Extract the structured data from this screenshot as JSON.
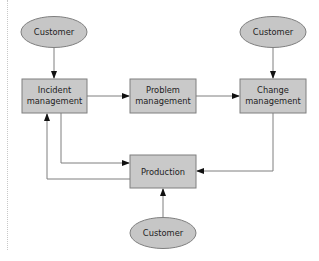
{
  "diagram": {
    "colors": {
      "box_fill": "#c9c9c9",
      "ellipse_fill": "#c6c6c6",
      "stroke": "#7f7f7f",
      "text": "#222222"
    },
    "nodes": {
      "customer_top_left": {
        "label": "Customer",
        "shape": "ellipse"
      },
      "customer_top_right": {
        "label": "Customer",
        "shape": "ellipse"
      },
      "customer_bottom": {
        "label": "Customer",
        "shape": "ellipse"
      },
      "incident": {
        "label_line1": "Incident",
        "label_line2": "management",
        "shape": "box"
      },
      "problem": {
        "label_line1": "Problem",
        "label_line2": "management",
        "shape": "box"
      },
      "change": {
        "label_line1": "Change",
        "label_line2": "management",
        "shape": "box"
      },
      "production": {
        "label": "Production",
        "shape": "box"
      }
    },
    "edges": [
      {
        "from": "Customer (top-left)",
        "to": "Incident management"
      },
      {
        "from": "Incident management",
        "to": "Problem management"
      },
      {
        "from": "Problem management",
        "to": "Change management"
      },
      {
        "from": "Customer (top-right)",
        "to": "Change management"
      },
      {
        "from": "Change management",
        "to": "Production"
      },
      {
        "from": "Incident management",
        "to": "Production"
      },
      {
        "from": "Production",
        "to": "Incident management"
      },
      {
        "from": "Customer (bottom)",
        "to": "Production"
      }
    ]
  }
}
